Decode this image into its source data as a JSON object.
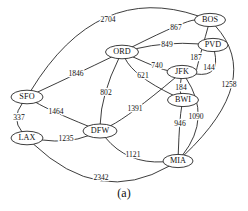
{
  "figure": {
    "caption": "(a)",
    "type": "undirected-weighted-graph"
  },
  "style": {
    "background": "#ffffff",
    "stroke": "#1a1a1a",
    "node_fill": "#ffffff",
    "text": "#111111"
  },
  "chart_data": {
    "type": "diagram",
    "title": "",
    "nodes": [
      {
        "id": "SFO",
        "label": "SFO",
        "x": 27,
        "y": 97,
        "rx": 16,
        "ry": 6.8
      },
      {
        "id": "LAX",
        "label": "LAX",
        "x": 27,
        "y": 138,
        "rx": 16,
        "ry": 6.8
      },
      {
        "id": "DFW",
        "label": "DFW",
        "x": 100,
        "y": 131,
        "rx": 17,
        "ry": 7.0
      },
      {
        "id": "ORD",
        "label": "ORD",
        "x": 122,
        "y": 52,
        "rx": 16.5,
        "ry": 6.8
      },
      {
        "id": "JFK",
        "label": "JFK",
        "x": 182,
        "y": 72,
        "rx": 15,
        "ry": 6.6
      },
      {
        "id": "BWI",
        "label": "BWI",
        "x": 183,
        "y": 100,
        "rx": 15.5,
        "ry": 6.6
      },
      {
        "id": "MIA",
        "label": "MIA",
        "x": 178,
        "y": 161,
        "rx": 15,
        "ry": 6.6
      },
      {
        "id": "BOS",
        "label": "BOS",
        "x": 210,
        "y": 20,
        "rx": 15.5,
        "ry": 6.6
      },
      {
        "id": "PVD",
        "label": "PVD",
        "x": 213,
        "y": 45,
        "rx": 15,
        "ry": 6.6
      }
    ],
    "edges": [
      {
        "from": "SFO",
        "to": "BOS",
        "weight": 2704,
        "label_x": 108,
        "label_y": 20
      },
      {
        "from": "SFO",
        "to": "ORD",
        "weight": 1846,
        "label_x": 76,
        "label_y": 74
      },
      {
        "from": "SFO",
        "to": "LAX",
        "weight": 337,
        "label_x": 19,
        "label_y": 118
      },
      {
        "from": "SFO",
        "to": "DFW",
        "weight": 1464,
        "label_x": 56,
        "label_y": 112
      },
      {
        "from": "LAX",
        "to": "DFW",
        "weight": 1235,
        "label_x": 66,
        "label_y": 139
      },
      {
        "from": "LAX",
        "to": "MIA",
        "weight": 2342,
        "label_x": 101,
        "label_y": 178
      },
      {
        "from": "DFW",
        "to": "ORD",
        "weight": 802,
        "label_x": 106,
        "label_y": 93
      },
      {
        "from": "DFW",
        "to": "JFK",
        "weight": 1391,
        "label_x": 135,
        "label_y": 109
      },
      {
        "from": "DFW",
        "to": "MIA",
        "weight": 1121,
        "label_x": 133,
        "label_y": 155
      },
      {
        "from": "ORD",
        "to": "JFK",
        "weight": 740,
        "label_x": 157,
        "label_y": 66
      },
      {
        "from": "ORD",
        "to": "BWI",
        "weight": 621,
        "label_x": 143,
        "label_y": 76
      },
      {
        "from": "ORD",
        "to": "BOS",
        "weight": 867,
        "label_x": 176,
        "label_y": 28
      },
      {
        "from": "ORD",
        "to": "PVD",
        "weight": 849,
        "label_x": 167,
        "label_y": 45
      },
      {
        "from": "JFK",
        "to": "BWI",
        "weight": 184,
        "label_x": 181,
        "label_y": 88
      },
      {
        "from": "JFK",
        "to": "BOS",
        "weight": 187,
        "label_x": 196,
        "label_y": 58
      },
      {
        "from": "JFK",
        "to": "PVD",
        "weight": 144,
        "label_x": 209,
        "label_y": 68
      },
      {
        "from": "JFK",
        "to": "MIA",
        "weight": 1090,
        "label_x": 196,
        "label_y": 117
      },
      {
        "from": "BWI",
        "to": "MIA",
        "weight": 946,
        "label_x": 180,
        "label_y": 124
      },
      {
        "from": "BOS",
        "to": "MIA",
        "weight": 1258,
        "label_x": 229,
        "label_y": 85
      }
    ]
  }
}
